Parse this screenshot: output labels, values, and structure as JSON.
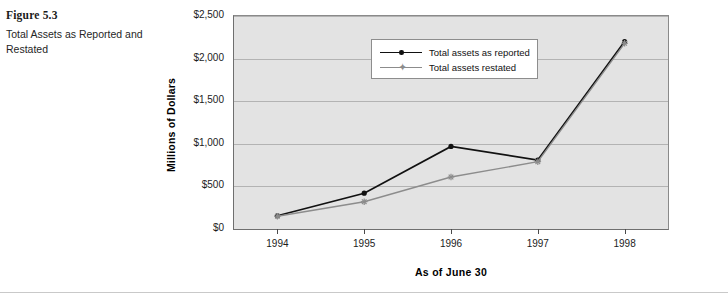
{
  "figure": {
    "number_label": "Figure 5.3",
    "caption": "Total Assets as Reported and Restated"
  },
  "chart_data": {
    "type": "line",
    "title": "",
    "xlabel": "As of June 30",
    "ylabel": "Millions of Dollars",
    "x": [
      "1994",
      "1995",
      "1996",
      "1997",
      "1998"
    ],
    "categories": [
      "1994",
      "1995",
      "1996",
      "1997",
      "1998"
    ],
    "ylim": [
      0,
      2500
    ],
    "yticks": [
      0,
      500,
      1000,
      1500,
      2000,
      2500
    ],
    "ytick_labels": [
      "$0",
      "$500",
      "$1,000",
      "$1,500",
      "$2,000",
      "$2,500"
    ],
    "grid": true,
    "legend_position": "top-center",
    "series": [
      {
        "name": "Total assets as reported",
        "values": [
          155,
          420,
          970,
          810,
          2200
        ],
        "color": "#111111",
        "marker": "circle"
      },
      {
        "name": "Total assets restated",
        "values": [
          150,
          320,
          610,
          790,
          2180
        ],
        "color": "#8c8c8c",
        "marker": "star"
      }
    ]
  },
  "colors": {
    "plot_background": "#e3e3e3",
    "gridline": "#b3b3b3",
    "series_reported": "#111111",
    "series_restated": "#8c8c8c"
  }
}
